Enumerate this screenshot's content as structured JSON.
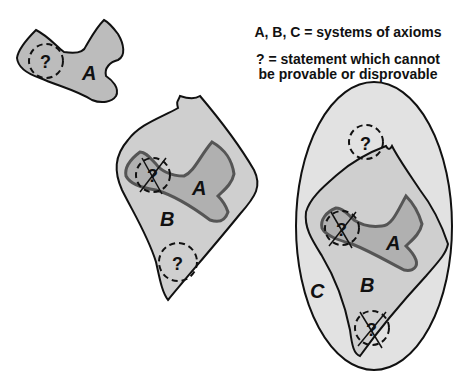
{
  "legend": {
    "line1": "A, B, C = systems of axioms",
    "line2": "? = statement which cannot",
    "line3": "be provable or disprovable"
  },
  "labels": {
    "A": "A",
    "B": "B",
    "C": "C",
    "question": "?"
  },
  "colors": {
    "outline": "#111111",
    "system_A_fill": "#b8b8b8",
    "system_A_outline": "#555555",
    "system_B_fill": "#cfcfcf",
    "system_C_fill": "#e2e2e2",
    "background": "#ffffff"
  }
}
